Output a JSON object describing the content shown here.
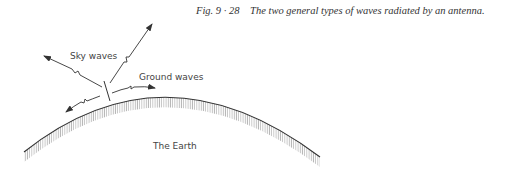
{
  "figure": {
    "number": "Fig. 9 · 28",
    "caption": "The two general types of waves radiated by an antenna."
  },
  "labels": {
    "sky_waves": "Sky waves",
    "ground_waves": "Ground waves",
    "earth": "The Earth"
  },
  "colors": {
    "line": "#333333",
    "hatch": "#9a9a9a",
    "text": "#444444"
  }
}
